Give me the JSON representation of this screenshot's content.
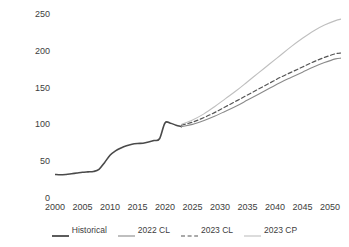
{
  "chart_data": {
    "type": "line",
    "title": "",
    "subtitle": "",
    "xlabel": "",
    "ylabel": "GDP 대비 비율",
    "xlim": [
      2000,
      2052
    ],
    "ylim": [
      0,
      250
    ],
    "grid": false,
    "legend_position": "bottom",
    "x_ticks": [
      "2000",
      "2005",
      "2010",
      "2015",
      "2020",
      "2025",
      "2030",
      "2035",
      "2040",
      "2045",
      "2050"
    ],
    "x_tick_values": [
      2000,
      2005,
      2010,
      2015,
      2020,
      2025,
      2030,
      2035,
      2040,
      2045,
      2050
    ],
    "y_ticks": [
      "0",
      "50",
      "100",
      "150",
      "200",
      "250"
    ],
    "y_tick_values": [
      0,
      50,
      100,
      150,
      200,
      250
    ],
    "series": [
      {
        "name": "Historical",
        "style": "solid",
        "color": "#4a4a4a",
        "width": 1.6,
        "x": [
          2000,
          2001,
          2002,
          2003,
          2004,
          2005,
          2006,
          2007,
          2008,
          2009,
          2010,
          2011,
          2012,
          2013,
          2014,
          2015,
          2016,
          2017,
          2018,
          2019,
          2020,
          2021,
          2022,
          2023
        ],
        "values": [
          32,
          31.5,
          32,
          33,
          34,
          35,
          35.5,
          36,
          39,
          48,
          58,
          64,
          68,
          71,
          73,
          74,
          74.5,
          76,
          78,
          80.5,
          102,
          101.5,
          99,
          97
        ]
      },
      {
        "name": "2022 CL",
        "style": "solid",
        "color": "#8a8a8a",
        "width": 1.1,
        "x": [
          2023,
          2025,
          2027,
          2029,
          2031,
          2033,
          2035,
          2037,
          2039,
          2041,
          2043,
          2045,
          2047,
          2049,
          2051,
          2052
        ],
        "values": [
          97,
          100,
          105,
          111,
          118,
          125,
          133,
          141,
          149,
          157,
          164,
          171,
          178,
          184,
          189,
          190
        ]
      },
      {
        "name": "2023 CL",
        "style": "dashed",
        "color": "#555555",
        "width": 1.2,
        "x": [
          2023,
          2025,
          2027,
          2029,
          2031,
          2033,
          2035,
          2037,
          2039,
          2041,
          2043,
          2045,
          2047,
          2049,
          2051,
          2052
        ],
        "values": [
          99,
          103,
          109,
          116,
          124,
          132,
          140,
          148,
          156,
          164,
          171,
          178,
          185,
          191,
          196,
          197
        ]
      },
      {
        "name": "2023 CP",
        "style": "solid",
        "color": "#bfbfbf",
        "width": 1.1,
        "x": [
          2023,
          2025,
          2027,
          2029,
          2031,
          2033,
          2035,
          2037,
          2039,
          2041,
          2043,
          2045,
          2047,
          2049,
          2051,
          2052
        ],
        "values": [
          100,
          106,
          114,
          124,
          135,
          146,
          158,
          170,
          182,
          194,
          206,
          217,
          227,
          235,
          241,
          243
        ]
      }
    ]
  },
  "legend": {
    "items": [
      {
        "label": "Historical"
      },
      {
        "label": "2022 CL"
      },
      {
        "label": "2023 CL"
      },
      {
        "label": "2023 CP"
      }
    ]
  }
}
